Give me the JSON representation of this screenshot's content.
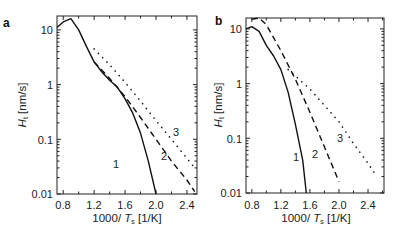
{
  "chart_data": [
    {
      "type": "line",
      "panel_label": "a",
      "title": "",
      "xlabel": "1000/ T_s [1/K]",
      "ylabel": "H_t [nm/s]",
      "xlim": [
        0.72,
        2.53
      ],
      "ylim": [
        0.01,
        18
      ],
      "yscale": "log",
      "xticks": [
        "0.8",
        "1.2",
        "1.6",
        "2.0",
        "2.4"
      ],
      "yticks": [
        "0.01",
        "0.1",
        "1",
        "10"
      ],
      "grid": false,
      "series": [
        {
          "name": "1",
          "style": "solid",
          "x": [
            0.72,
            0.8,
            0.9,
            1.0,
            1.1,
            1.2,
            1.3,
            1.4,
            1.5,
            1.6,
            1.7,
            1.8,
            1.9,
            2.0
          ],
          "values": [
            11,
            14,
            16,
            10,
            5,
            2.6,
            1.7,
            1.2,
            0.9,
            0.55,
            0.3,
            0.13,
            0.04,
            0.01
          ]
        },
        {
          "name": "2",
          "style": "dashed",
          "x": [
            1.2,
            1.4,
            1.6,
            1.8,
            2.0,
            2.2,
            2.4,
            2.5
          ],
          "values": [
            2.6,
            1.3,
            0.6,
            0.25,
            0.1,
            0.04,
            0.018,
            0.011
          ]
        },
        {
          "name": "3",
          "style": "dotted",
          "x": [
            1.2,
            1.4,
            1.6,
            1.8,
            2.0,
            2.2,
            2.4,
            2.5
          ],
          "values": [
            4.5,
            2.3,
            1.1,
            0.5,
            0.22,
            0.1,
            0.045,
            0.03
          ]
        }
      ],
      "annotations": [
        "1",
        "2",
        "3"
      ]
    },
    {
      "type": "line",
      "panel_label": "b",
      "title": "",
      "xlabel": "1000/ T_s [1/K]",
      "ylabel": "H_t [nm/s]",
      "xlim": [
        0.72,
        2.62
      ],
      "ylim": [
        0.01,
        18
      ],
      "yscale": "log",
      "xticks": [
        "0.8",
        "1.2",
        "1.6",
        "2.0",
        "2.4"
      ],
      "yticks": [
        "0.01",
        "0.1",
        "1",
        "10"
      ],
      "grid": false,
      "series": [
        {
          "name": "1",
          "style": "solid",
          "x": [
            0.72,
            0.8,
            0.9,
            1.0,
            1.1,
            1.2,
            1.3,
            1.4,
            1.5,
            1.55
          ],
          "values": [
            10,
            11,
            9,
            5,
            3.2,
            1.8,
            0.7,
            0.18,
            0.04,
            0.01
          ]
        },
        {
          "name": "2",
          "style": "dashed",
          "x": [
            0.8,
            0.9,
            1.0,
            1.2,
            1.4,
            1.6,
            1.8,
            2.0
          ],
          "values": [
            15,
            17,
            12,
            4,
            1.2,
            0.3,
            0.07,
            0.016
          ]
        },
        {
          "name": "3",
          "style": "dotted",
          "x": [
            1.3,
            1.6,
            1.8,
            2.0,
            2.2,
            2.4,
            2.5
          ],
          "values": [
            1.8,
            0.8,
            0.4,
            0.2,
            0.08,
            0.035,
            0.022
          ]
        }
      ],
      "annotations": [
        "1",
        "2",
        "3"
      ]
    }
  ],
  "labels": {
    "a": {
      "panel": "a",
      "xlabel_main": "1000/ ",
      "xlabel_var": "T",
      "xlabel_sub": "s",
      "xlabel_unit": " [1/K]",
      "ylabel_var": "H",
      "ylabel_sub": "t",
      "ylabel_unit": " [nm/s]"
    },
    "b": {
      "panel": "b",
      "xlabel_main": "1000/ ",
      "xlabel_var": "T",
      "xlabel_sub": "s",
      "xlabel_unit": " [1/K]",
      "ylabel_var": "H",
      "ylabel_sub": "t",
      "ylabel_unit": " [nm/s]"
    }
  },
  "ticks": {
    "x": [
      "0.8",
      "1.2",
      "1.6",
      "2.0",
      "2.4"
    ],
    "y": [
      "10",
      "1",
      "0.1",
      "0.01"
    ]
  },
  "curve_labels": [
    "1",
    "2",
    "3"
  ]
}
